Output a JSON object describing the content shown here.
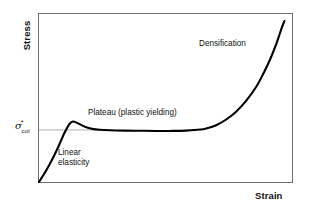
{
  "figure": {
    "background_color": "#ffffff",
    "frame_color": "#6f6f6f",
    "curve_color": "#000000",
    "reference_line_color": "#9a9a9a"
  },
  "axes": {
    "y_title": "Stress",
    "x_title": "Strain",
    "tick": {
      "symbol": "σ",
      "superscript": "*",
      "subscript": "col"
    }
  },
  "annotations": {
    "linear_line1": "Linear",
    "linear_line2": "elasticity",
    "plateau": "Plateau (plastic yielding)",
    "densification": "Densification"
  },
  "chart_data": {
    "type": "line",
    "title": "",
    "xlabel": "Strain",
    "ylabel": "Stress",
    "grid": false,
    "legend": null,
    "xlim": [
      0,
      1
    ],
    "ylim": [
      0,
      1
    ],
    "axis_ticks": {
      "x": [],
      "y": [
        "σ*col"
      ]
    },
    "annotations": [
      {
        "text": "Linear elasticity",
        "x": 0.09,
        "y": 0.2,
        "region": "elastic"
      },
      {
        "text": "Plateau (plastic yielding)",
        "x": 0.2,
        "y": 0.45,
        "region": "plateau"
      },
      {
        "text": "Densification",
        "x": 0.63,
        "y": 0.85,
        "region": "densification"
      }
    ],
    "reference_lines": [
      {
        "orientation": "horizontal",
        "y": 0.31,
        "label": "σ*col",
        "x_from": 0.0,
        "x_to": 0.28
      }
    ],
    "series": [
      {
        "name": "Stress-strain response of a cellular solid in compression",
        "x": [
          0.0,
          0.02,
          0.04,
          0.06,
          0.08,
          0.1,
          0.12,
          0.134,
          0.15,
          0.17,
          0.19,
          0.21,
          0.24,
          0.28,
          0.34,
          0.4,
          0.46,
          0.52,
          0.58,
          0.64,
          0.66,
          0.7,
          0.74,
          0.78,
          0.82,
          0.86,
          0.89,
          0.915,
          0.935,
          0.95,
          0.96,
          0.97
        ],
        "y": [
          0.0,
          0.048,
          0.1,
          0.158,
          0.222,
          0.29,
          0.345,
          0.36,
          0.352,
          0.337,
          0.324,
          0.316,
          0.311,
          0.308,
          0.306,
          0.305,
          0.304,
          0.304,
          0.306,
          0.312,
          0.318,
          0.338,
          0.372,
          0.42,
          0.486,
          0.57,
          0.655,
          0.735,
          0.81,
          0.875,
          0.92,
          0.958
        ]
      }
    ]
  }
}
